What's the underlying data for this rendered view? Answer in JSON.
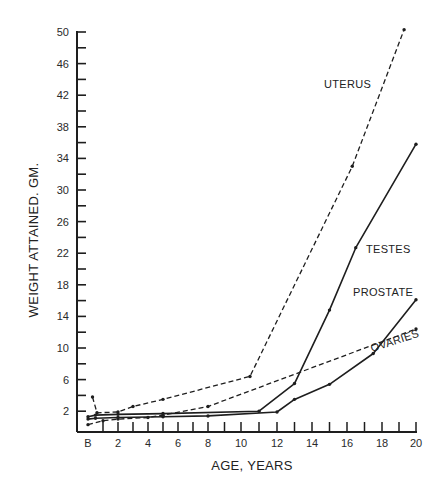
{
  "chart_data": {
    "type": "line",
    "title": "",
    "xlabel": "AGE, YEARS",
    "ylabel": "WEIGHT ATTAINED. GM.",
    "xlim": [
      0,
      20
    ],
    "ylim": [
      0,
      50
    ],
    "grid": false,
    "legend": "inline labels",
    "x_ticks": [
      {
        "value": 0,
        "label": "B"
      },
      {
        "value": 2,
        "label": "2"
      },
      {
        "value": 4,
        "label": "4"
      },
      {
        "value": 6,
        "label": "6"
      },
      {
        "value": 8,
        "label": "8"
      },
      {
        "value": 10,
        "label": "10"
      },
      {
        "value": 12,
        "label": "12"
      },
      {
        "value": 14,
        "label": "14"
      },
      {
        "value": 16,
        "label": "16"
      },
      {
        "value": 18,
        "label": "18"
      },
      {
        "value": 20,
        "label": "20"
      }
    ],
    "y_ticks": [
      2,
      6,
      10,
      14,
      18,
      22,
      26,
      30,
      34,
      38,
      42,
      46,
      50
    ],
    "y_minor_step": 2,
    "series": [
      {
        "name": "UTERUS",
        "style": "dashed",
        "points": [
          [
            0.3,
            3.8
          ],
          [
            0.6,
            1.8
          ],
          [
            2,
            1.9
          ],
          [
            3,
            2.6
          ],
          [
            5,
            3.5
          ],
          [
            10.5,
            6.4
          ],
          [
            16.3,
            33
          ],
          [
            19.3,
            50.3
          ]
        ]
      },
      {
        "name": "TESTES",
        "style": "solid",
        "points": [
          [
            0,
            1.3
          ],
          [
            0.5,
            1.5
          ],
          [
            2,
            1.6
          ],
          [
            5,
            1.7
          ],
          [
            11,
            2.0
          ],
          [
            13,
            5.5
          ],
          [
            15,
            14.8
          ],
          [
            16.5,
            22.7
          ],
          [
            20,
            35.8
          ]
        ]
      },
      {
        "name": "PROSTATE",
        "style": "solid",
        "points": [
          [
            0,
            1.0
          ],
          [
            0.5,
            1.1
          ],
          [
            2,
            1.2
          ],
          [
            5,
            1.3
          ],
          [
            8,
            1.4
          ],
          [
            12,
            1.9
          ],
          [
            13,
            3.5
          ],
          [
            15,
            5.4
          ],
          [
            17.5,
            9.3
          ],
          [
            20,
            16.1
          ]
        ]
      },
      {
        "name": "OVARIES",
        "style": "dashed",
        "points": [
          [
            0,
            0.3
          ],
          [
            1,
            0.8
          ],
          [
            2,
            1.0
          ],
          [
            4,
            1.2
          ],
          [
            5,
            1.5
          ],
          [
            8,
            2.6
          ],
          [
            20,
            12.4
          ]
        ]
      }
    ],
    "labels": [
      {
        "series": "UTERUS",
        "text": "UTERUS"
      },
      {
        "series": "TESTES",
        "text": "TESTES"
      },
      {
        "series": "PROSTATE",
        "text": "PROSTATE"
      },
      {
        "series": "OVARIES",
        "text": "OVARIES"
      }
    ],
    "colors": {
      "ink": "#1e1e1e",
      "background": "#ffffff"
    }
  }
}
